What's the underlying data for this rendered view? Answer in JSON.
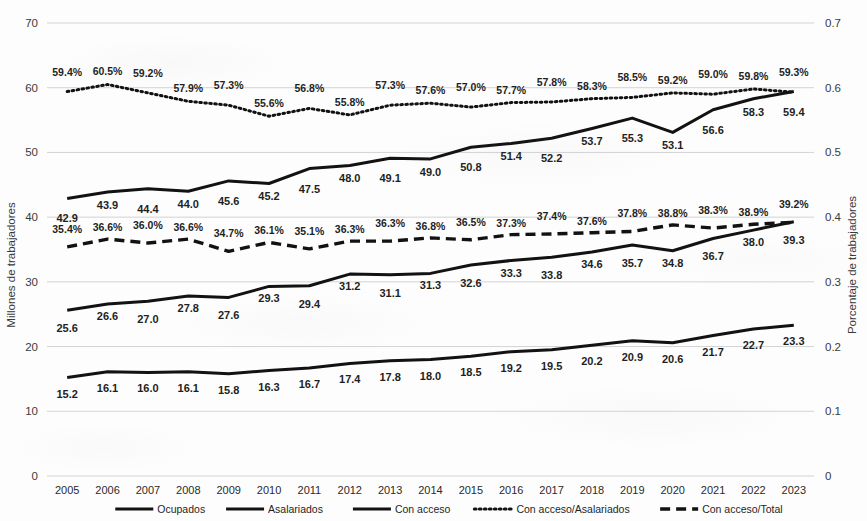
{
  "chart_data": {
    "type": "line",
    "title": "",
    "subtitle": "",
    "xlabel": "",
    "ylabel": "Millones de trabajadores",
    "y2label": "Porcentaje de trabajadores",
    "grid": true,
    "legend_position": "bottom",
    "categories": [
      "2005",
      "2006",
      "2007",
      "2008",
      "2009",
      "2010",
      "2011",
      "2012",
      "2013",
      "2014",
      "2015",
      "2016",
      "2017",
      "2018",
      "2019",
      "2020",
      "2021",
      "2022",
      "2023"
    ],
    "ylim": [
      0,
      70
    ],
    "yticks": [
      "0",
      "10",
      "20",
      "30",
      "40",
      "50",
      "60",
      "70"
    ],
    "y2lim": [
      0,
      0.7
    ],
    "y2ticks": [
      "0",
      "0.1",
      "0.2",
      "0.3",
      "0.4",
      "0.5",
      "0.6",
      "0.7"
    ],
    "series": [
      {
        "name": "Ocupados",
        "axis": "left",
        "style": "solid",
        "color": "#121212",
        "values": [
          42.9,
          43.9,
          44.4,
          44.0,
          45.6,
          45.2,
          47.5,
          48.0,
          49.1,
          49.0,
          50.8,
          51.4,
          52.2,
          53.7,
          55.3,
          53.1,
          56.6,
          58.3,
          59.4
        ],
        "labels": [
          "42.9",
          "43.9",
          "44.4",
          "44.0",
          "45.6",
          "45.2",
          "47.5",
          "48.0",
          "49.1",
          "49.0",
          "50.8",
          "51.4",
          "52.2",
          "53.7",
          "55.3",
          "53.1",
          "56.6",
          "58.3",
          "59.4"
        ]
      },
      {
        "name": "Asalariados",
        "axis": "left",
        "style": "solid",
        "color": "#121212",
        "values": [
          25.6,
          26.6,
          27.0,
          27.8,
          27.6,
          29.3,
          29.4,
          31.2,
          31.1,
          31.3,
          32.6,
          33.3,
          33.8,
          34.6,
          35.7,
          34.8,
          36.7,
          38.0,
          39.3
        ],
        "labels": [
          "25.6",
          "26.6",
          "27.0",
          "27.8",
          "27.6",
          "29.3",
          "29.4",
          "31.2",
          "31.1",
          "31.3",
          "32.6",
          "33.3",
          "33.8",
          "34.6",
          "35.7",
          "34.8",
          "36.7",
          "38.0",
          "39.3"
        ]
      },
      {
        "name": "Con acceso",
        "axis": "left",
        "style": "solid",
        "color": "#121212",
        "values": [
          15.2,
          16.1,
          16.0,
          16.1,
          15.8,
          16.3,
          16.7,
          17.4,
          17.8,
          18.0,
          18.5,
          19.2,
          19.5,
          20.2,
          20.9,
          20.6,
          21.7,
          22.7,
          23.3
        ],
        "labels": [
          "15.2",
          "16.1",
          "16.0",
          "16.1",
          "15.8",
          "16.3",
          "16.7",
          "17.4",
          "17.8",
          "18.0",
          "18.5",
          "19.2",
          "19.5",
          "20.2",
          "20.9",
          "20.6",
          "21.7",
          "22.7",
          "23.3"
        ]
      },
      {
        "name": "Con acceso/Asalariados",
        "axis": "right",
        "style": "dotted",
        "color": "#121212",
        "values": [
          0.594,
          0.605,
          0.592,
          0.579,
          0.573,
          0.556,
          0.568,
          0.558,
          0.573,
          0.576,
          0.57,
          0.577,
          0.578,
          0.583,
          0.585,
          0.592,
          0.59,
          0.598,
          0.593
        ],
        "labels": [
          "59.4%",
          "60.5%",
          "59.2%",
          "57.9%",
          "57.3%",
          "55.6%",
          "56.8%",
          "55.8%",
          "57.3%",
          "57.6%",
          "57.0%",
          "57.7%",
          "57.8%",
          "58.3%",
          "58.5%",
          "59.2%",
          "59.0%",
          "59.8%",
          "59.3%"
        ]
      },
      {
        "name": "Con acceso/Total",
        "axis": "right",
        "style": "dashed",
        "color": "#121212",
        "values": [
          0.354,
          0.366,
          0.36,
          0.366,
          0.347,
          0.361,
          0.351,
          0.363,
          0.363,
          0.368,
          0.365,
          0.373,
          0.374,
          0.376,
          0.378,
          0.388,
          0.383,
          0.389,
          0.392
        ],
        "labels": [
          "35.4%",
          "36.6%",
          "36.0%",
          "36.6%",
          "34.7%",
          "36.1%",
          "35.1%",
          "36.3%",
          "36.3%",
          "36.8%",
          "36.5%",
          "37.3%",
          "37.4%",
          "37.6%",
          "37.8%",
          "38.8%",
          "38.3%",
          "38.9%",
          "39.2%"
        ]
      }
    ]
  },
  "legend": {
    "items": [
      {
        "label": "Ocupados",
        "style": "solid"
      },
      {
        "label": "Asalariados",
        "style": "solid"
      },
      {
        "label": "Con acceso",
        "style": "solid"
      },
      {
        "label": "Con acceso/Asalariados",
        "style": "dotted"
      },
      {
        "label": "Con acceso/Total",
        "style": "dashed"
      }
    ]
  }
}
